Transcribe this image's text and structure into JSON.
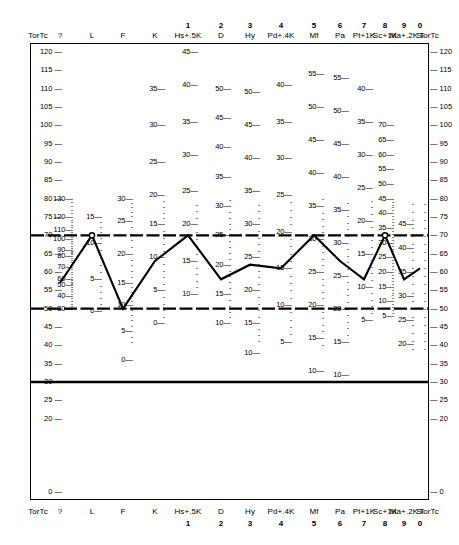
{
  "sheet": {
    "corner_label": "TorTc",
    "scale_labels": [
      "?",
      "L",
      "F",
      "K",
      "Hs+.5K",
      "D",
      "Hy",
      "Pd+.4K",
      "Mf",
      "Pa",
      "Pt+1K",
      "Sc+1K",
      "Ma+.2K",
      "Si"
    ],
    "scale_numbers": [
      "",
      "",
      "",
      "",
      "1",
      "2",
      "3",
      "4",
      "5",
      "6",
      "7",
      "8",
      "9",
      "0"
    ]
  },
  "chart_data": {
    "type": "line",
    "xlabel": "",
    "ylabel": "TorTc",
    "ylim": [
      0,
      120
    ],
    "grid": false,
    "legend": "none",
    "categories": [
      "?",
      "L",
      "F",
      "K",
      "Hs+.5K",
      "D",
      "Hy",
      "Pd+.4K",
      "Mf",
      "Pa",
      "Pt+1K",
      "Sc+1K",
      "Ma+.2K",
      "Si"
    ],
    "series": [
      {
        "name": "Profile",
        "values": [
          57,
          70,
          50,
          63,
          70,
          58,
          62,
          61,
          70,
          63,
          58,
          70,
          58,
          61
        ]
      }
    ],
    "t_axis_ticks": [
      120,
      115,
      110,
      105,
      100,
      95,
      90,
      85,
      80,
      75,
      70,
      65,
      60,
      55,
      50,
      45,
      40,
      35,
      30,
      25,
      20,
      0
    ],
    "reference_lines": [
      {
        "label": "T=70",
        "value": 70,
        "style": "heavy-dashed"
      },
      {
        "label": "T=50",
        "value": 50,
        "style": "heavy-dashed"
      },
      {
        "label": "T=30",
        "value": 30,
        "style": "heavy-solid"
      }
    ],
    "raw_score_scales": [
      {
        "scale": "?",
        "ticks": [
          130,
          120,
          110,
          100,
          90,
          80,
          70,
          60,
          50,
          40,
          30
        ]
      },
      {
        "scale": "L",
        "ticks": [
          15,
          10,
          5,
          0
        ]
      },
      {
        "scale": "F",
        "ticks": [
          30,
          25,
          20,
          15,
          10,
          5,
          0
        ]
      },
      {
        "scale": "K",
        "ticks": [
          35,
          30,
          25,
          20,
          15,
          10,
          5,
          0
        ]
      },
      {
        "scale": "Hs+.5K",
        "ticks": [
          45,
          40,
          35,
          30,
          25,
          20,
          15,
          10
        ]
      },
      {
        "scale": "D",
        "ticks": [
          50,
          45,
          40,
          35,
          30,
          25,
          20,
          15,
          10
        ]
      },
      {
        "scale": "Hy",
        "ticks": [
          50,
          45,
          40,
          35,
          30,
          25,
          20,
          15,
          10
        ]
      },
      {
        "scale": "Pd+.4K",
        "ticks": [
          40,
          35,
          30,
          25,
          20,
          15,
          10,
          5
        ]
      },
      {
        "scale": "Mf",
        "ticks": [
          55,
          50,
          45,
          40,
          35,
          30,
          25,
          20,
          15,
          10
        ]
      },
      {
        "scale": "Pa",
        "ticks": [
          55,
          50,
          45,
          40,
          35,
          30,
          25,
          20,
          15,
          10
        ]
      },
      {
        "scale": "Pt+1K",
        "ticks": [
          40,
          35,
          30,
          25,
          20,
          15,
          10,
          5
        ]
      },
      {
        "scale": "Sc+1K",
        "ticks": [
          70,
          65,
          60,
          55,
          50,
          45,
          40,
          35,
          30,
          25,
          20,
          15,
          10,
          5
        ]
      },
      {
        "scale": "Si",
        "ticks": [
          45,
          40,
          35,
          30,
          25,
          20
        ]
      }
    ]
  }
}
